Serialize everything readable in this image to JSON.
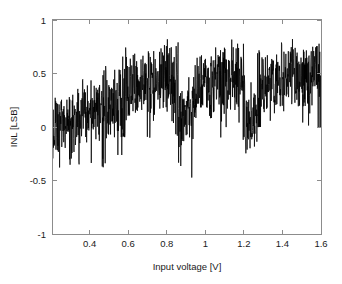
{
  "chart_data": {
    "type": "line",
    "title": "",
    "xlabel": "Input voltage [V]",
    "ylabel": "INL [LSB]",
    "xlim": [
      0.21,
      1.6
    ],
    "ylim": [
      -1,
      1
    ],
    "xticks": [
      0.4,
      0.6,
      0.8,
      1,
      1.2,
      1.4,
      1.6
    ],
    "xticklabels": [
      "0.4",
      "0.6",
      "0.8",
      "1",
      "1.2",
      "1.4",
      "1.6"
    ],
    "yticks": [
      1,
      0.5,
      0,
      -0.5,
      -1
    ],
    "yticklabels": [
      "1",
      "0.5",
      "0",
      "-0.5",
      "-1"
    ],
    "grid": false,
    "legend": null,
    "line_color": "#000000",
    "axis_color": "#8c8c8c",
    "background_color": "#ffffff",
    "series": [
      {
        "name": "INL",
        "description": "Integral non-linearity error versus input voltage, dense noisy trace with segment-wise DC level steps and deep negative notches near 0.30 V, 0.55 V, 0.90 V and 1.23 V.",
        "segments": [
          {
            "x_start": 0.21,
            "x_end": 0.3,
            "baseline": 0.02,
            "noise": 0.22,
            "notch": -0.48
          },
          {
            "x_start": 0.3,
            "x_end": 0.47,
            "baseline": 0.1,
            "noise": 0.22,
            "notch": -0.42
          },
          {
            "x_start": 0.47,
            "x_end": 0.57,
            "baseline": 0.22,
            "noise": 0.26,
            "notch": -0.47
          },
          {
            "x_start": 0.57,
            "x_end": 0.86,
            "baseline": 0.42,
            "noise": 0.26,
            "notch": -0.1
          },
          {
            "x_start": 0.86,
            "x_end": 0.93,
            "baseline": 0.08,
            "noise": 0.24,
            "notch": -0.48
          },
          {
            "x_start": 0.93,
            "x_end": 1.21,
            "baseline": 0.42,
            "noise": 0.26,
            "notch": -0.12
          },
          {
            "x_start": 1.21,
            "x_end": 1.27,
            "baseline": 0.05,
            "noise": 0.22,
            "notch": -0.36
          },
          {
            "x_start": 1.27,
            "x_end": 1.6,
            "baseline": 0.45,
            "noise": 0.24,
            "notch": 0.0
          }
        ],
        "y_min": -0.48,
        "y_max": 0.83,
        "n_points": 1100
      }
    ]
  },
  "axes": {
    "x_title": "Input voltage [V]",
    "y_title": "INL [LSB]"
  }
}
